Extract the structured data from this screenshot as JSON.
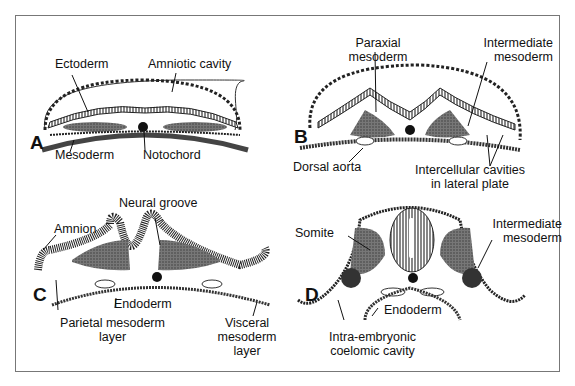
{
  "figure": {
    "panels": {
      "A": {
        "letter": "A",
        "labels": {
          "ectoderm": "Ectoderm",
          "amniotic_cavity": "Amniotic cavity",
          "mesoderm": "Mesoderm",
          "notochord": "Notochord"
        }
      },
      "B": {
        "letter": "B",
        "labels": {
          "paraxial_1": "Paraxial",
          "paraxial_2": "mesoderm",
          "intermediate_1": "Intermediate",
          "intermediate_2": "mesoderm",
          "dorsal_aorta": "Dorsal aorta",
          "intercellular_1": "Intercellular cavities",
          "intercellular_2": "in lateral plate"
        }
      },
      "C": {
        "letter": "C",
        "labels": {
          "neural_groove": "Neural groove",
          "amnion": "Amnion",
          "endoderm": "Endoderm",
          "parietal_1": "Parietal mesoderm",
          "parietal_2": "layer",
          "visceral_1": "Visceral",
          "visceral_2": "mesoderm",
          "visceral_3": "layer"
        }
      },
      "D": {
        "letter": "D",
        "labels": {
          "somite": "Somite",
          "intermediate_1": "Intermediate",
          "intermediate_2": "mesoderm",
          "endoderm": "Endoderm",
          "coelom_1": "Intra-embryonic",
          "coelom_2": "coelomic cavity"
        }
      }
    },
    "colors": {
      "ink": "#111111",
      "frame": "#777777",
      "shade": "#555555"
    }
  }
}
